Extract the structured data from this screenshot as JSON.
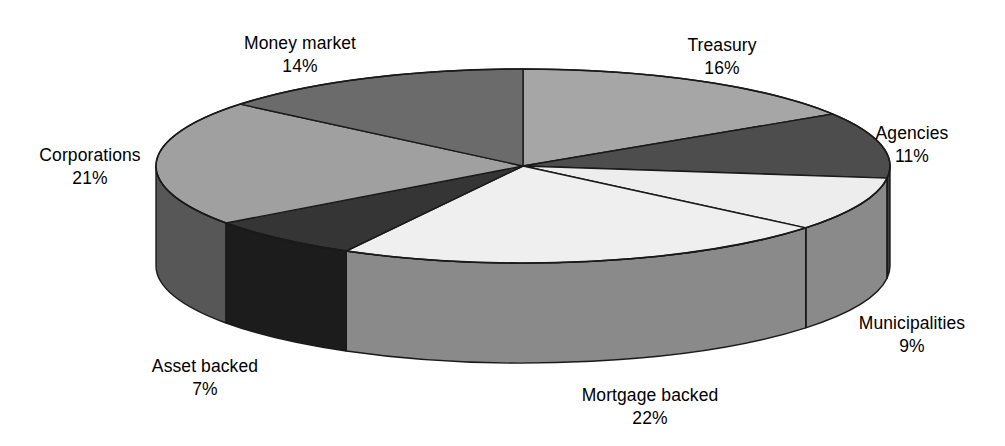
{
  "chart_data": {
    "type": "pie",
    "title": "",
    "subtitle": "",
    "xlabel": "",
    "ylabel": "",
    "legend_position": "none",
    "grid": false,
    "three_d": true,
    "units": "percent",
    "start_angle_deg": 0,
    "direction": "clockwise",
    "categories": [
      "Treasury",
      "Agencies",
      "Municipalities",
      "Mortgage backed",
      "Asset backed",
      "Corporations",
      "Money market"
    ],
    "values": [
      16,
      11,
      9,
      22,
      7,
      21,
      14
    ],
    "slices": [
      {
        "name": "Treasury",
        "value": 16,
        "value_label": "16%",
        "color": "#a6a6a6",
        "side_color": "#8f8f8f",
        "label_x": 722,
        "label_y": 34
      },
      {
        "name": "Agencies",
        "value": 11,
        "value_label": "11%",
        "color": "#4d4d4d",
        "side_color": "#3d3d3d",
        "label_x": 912,
        "label_y": 122
      },
      {
        "name": "Municipalities",
        "value": 9,
        "value_label": "9%",
        "color": "#ededed",
        "side_color": "#8a8a8a",
        "label_x": 912,
        "label_y": 312
      },
      {
        "name": "Mortgage backed",
        "value": 22,
        "value_label": "22%",
        "color": "#efefef",
        "side_color": "#8a8a8a",
        "label_x": 650,
        "label_y": 384
      },
      {
        "name": "Asset backed",
        "value": 7,
        "value_label": "7%",
        "color": "#353535",
        "side_color": "#1c1c1c",
        "label_x": 205,
        "label_y": 355
      },
      {
        "name": "Corporations",
        "value": 21,
        "value_label": "21%",
        "color": "#a0a0a0",
        "side_color": "#575757",
        "label_x": 90,
        "label_y": 144
      },
      {
        "name": "Money market",
        "value": 14,
        "value_label": "14%",
        "color": "#6b6b6b",
        "side_color": "#565656",
        "label_x": 300,
        "label_y": 32
      }
    ],
    "geometry": {
      "center_x": 523,
      "center_y": 166,
      "radius_x": 367,
      "radius_y": 97,
      "depth": 100
    },
    "stroke_color": "#1a1a1a",
    "background": "#ffffff"
  }
}
